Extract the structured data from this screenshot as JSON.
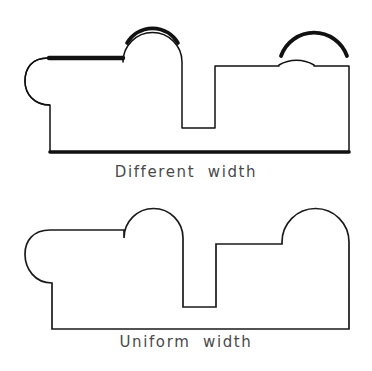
{
  "figures": [
    {
      "id": "different-width",
      "caption": "Different  width",
      "stroke_color": "#111111",
      "fill_color": "#ffffff",
      "line_style": "variable",
      "thin_stroke_px": 1.4,
      "thick_stroke_px": 4.2,
      "description": "Outline profile with left rounded lobe, two semicircular arches and a rectangular notch, drawn with uneven line thickness",
      "thick_segments": [
        "top-left horizontal shoulder",
        "top of left arch",
        "top of right arch",
        "bottom base line"
      ],
      "geometry": {
        "left_lobe_top_x": 48,
        "left_lobe_top_y": 58,
        "left_lobe_extreme_x": 25,
        "left_lobe_bottom_y": 105,
        "shoulder_y": 58,
        "arch1_left_x": 123,
        "arch1_right_x": 182,
        "arch1_top_y": 32,
        "notch_left_x": 182,
        "notch_right_x": 215,
        "notch_bottom_y": 128,
        "shelf_y": 66,
        "arch2_left_x": 279,
        "arch2_right_x": 349,
        "arch2_top_y": 30,
        "base_y": 152,
        "base_left_x": 49,
        "right_edge_x": 349
      }
    },
    {
      "id": "uniform-width",
      "caption": "Uniform  width",
      "stroke_color": "#1a1a1a",
      "fill_color": "#ffffff",
      "line_style": "uniform",
      "thin_stroke_px": 1.6,
      "thick_stroke_px": 1.6,
      "description": "Same outline profile drawn with a single consistent line thickness throughout",
      "thick_segments": [],
      "geometry": {
        "left_lobe_top_x": 50,
        "left_lobe_top_y": 40,
        "left_lobe_extreme_x": 25,
        "left_lobe_bottom_y": 93,
        "shoulder_y": 40,
        "arch1_left_x": 124,
        "arch1_right_x": 183,
        "arch1_top_y": 15,
        "notch_left_x": 183,
        "notch_right_x": 216,
        "notch_bottom_y": 117,
        "shelf_y": 50,
        "arch2_left_x": 282,
        "arch2_right_x": 349,
        "arch2_top_y": 19,
        "base_y": 139,
        "base_left_x": 50,
        "right_edge_x": 349
      }
    }
  ],
  "page": {
    "background_color": "#ffffff",
    "caption_color": "#4a4a4a",
    "width": 372,
    "height": 371
  }
}
